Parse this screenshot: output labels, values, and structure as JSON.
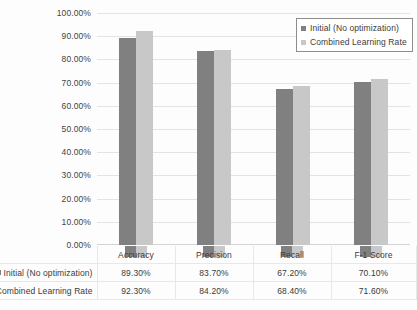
{
  "chart_data": {
    "type": "bar",
    "title": "",
    "xlabel": "",
    "ylabel": "",
    "ylim": [
      0,
      100
    ],
    "ytick_labels": [
      "100.00%",
      "90.00%",
      "80.00%",
      "70.00%",
      "60.00%",
      "50.00%",
      "40.00%",
      "30.00%",
      "20.00%",
      "10.00%",
      "0.00%"
    ],
    "ytick_values": [
      100,
      90,
      80,
      70,
      60,
      50,
      40,
      30,
      20,
      10,
      0
    ],
    "grid": true,
    "legend_position": "top-right",
    "categories": [
      "Accuracy",
      "Precision",
      "Recall",
      "F-1 Score"
    ],
    "series": [
      {
        "name": "Initial (No optimization)",
        "color": "#808080",
        "values": [
          89.3,
          83.7,
          67.2,
          70.1
        ],
        "labels": [
          "89.30%",
          "83.70%",
          "67.20%",
          "70.10%"
        ]
      },
      {
        "name": "Combined Learning Rate",
        "color": "#c8c8c8",
        "values": [
          92.3,
          84.2,
          68.4,
          71.6
        ],
        "labels": [
          "92.30%",
          "84.20%",
          "68.40%",
          "71.60%"
        ]
      }
    ]
  },
  "legend": {
    "entries": [
      {
        "label": "Initial (No optimization)",
        "color": "#808080"
      },
      {
        "label": "Combined Learning Rate",
        "color": "#c8c8c8"
      }
    ]
  },
  "data_table": {
    "column_headers": [
      "Accuracy",
      "Precision",
      "Recall",
      "F-1 Score"
    ],
    "rows": [
      {
        "label": "Initial (No optimization)",
        "color": "#808080",
        "cells": [
          "89.30%",
          "83.70%",
          "67.20%",
          "70.10%"
        ]
      },
      {
        "label": "Combined Learning Rate",
        "color": "#c8c8c8",
        "cells": [
          "92.30%",
          "84.20%",
          "68.40%",
          "71.60%"
        ]
      }
    ]
  }
}
